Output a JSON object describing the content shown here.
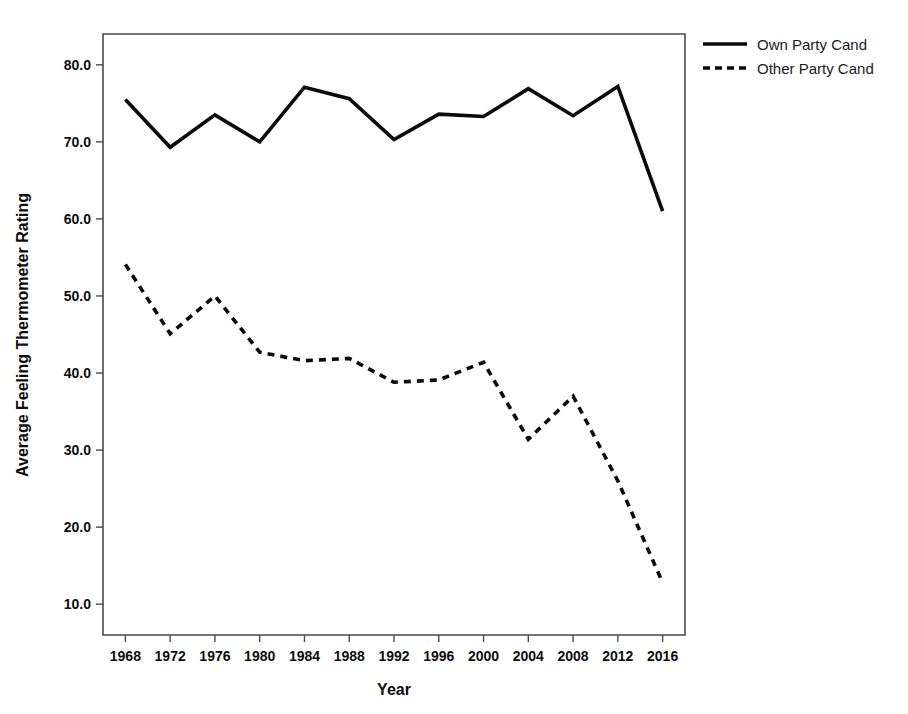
{
  "chart_data": {
    "type": "line",
    "title": "",
    "xlabel": "Year",
    "ylabel": "Average Feeling Thermometer Rating",
    "x": [
      1968,
      1972,
      1976,
      1980,
      1984,
      1988,
      1992,
      1996,
      2000,
      2004,
      2008,
      2012,
      2016
    ],
    "xtick_labels": [
      "1968",
      "1972",
      "1976",
      "1980",
      "1984",
      "1988",
      "1992",
      "1996",
      "2000",
      "2004",
      "2008",
      "2012",
      "2016"
    ],
    "ytick_labels": [
      "10.0",
      "20.0",
      "30.0",
      "40.0",
      "50.0",
      "60.0",
      "70.0",
      "80.0"
    ],
    "ytick_values": [
      10,
      20,
      30,
      40,
      50,
      60,
      70,
      80
    ],
    "ylim": [
      6,
      84
    ],
    "xlim": [
      1966,
      2018
    ],
    "grid": false,
    "legend_position": "top-right",
    "series": [
      {
        "name": "Own Party Cand",
        "style": "solid",
        "color": "#0a0a0a",
        "values": [
          75.5,
          69.3,
          73.5,
          70.0,
          77.1,
          75.6,
          70.3,
          73.6,
          73.3,
          76.9,
          73.4,
          77.2,
          61.0
        ]
      },
      {
        "name": "Other Party Cand",
        "style": "dashed",
        "color": "#0a0a0a",
        "values": [
          54.1,
          45.1,
          50.0,
          42.7,
          41.6,
          41.9,
          38.8,
          39.1,
          41.4,
          31.4,
          37.0,
          26.0,
          12.8
        ]
      }
    ]
  },
  "legend": {
    "entries": [
      {
        "label": "Own Party Cand",
        "style": "solid"
      },
      {
        "label": "Other Party Cand",
        "style": "dashed"
      }
    ]
  }
}
